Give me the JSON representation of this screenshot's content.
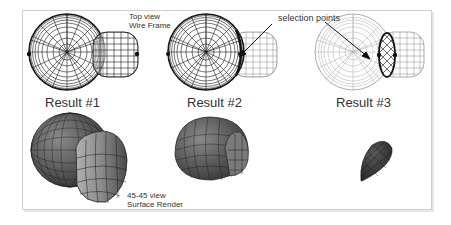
{
  "figure": {
    "panels": [
      {
        "id": "result1",
        "title": "Result #1"
      },
      {
        "id": "result2",
        "title": "Result #2"
      },
      {
        "id": "result3",
        "title": "Result #3"
      }
    ],
    "annotations": {
      "top_view_line1": "Top view",
      "top_view_line2": "Wire Frame",
      "selection_points": "selection points",
      "iso_view_line1": "45-45 view",
      "iso_view_line2": "Surface Render"
    },
    "colors": {
      "wire": "#1a1a1a",
      "wire_faint": "#9a9a9a",
      "surface_dark": "#3a3a3a",
      "surface_mid": "#6e6e6e",
      "surface_light": "#9c9c9c",
      "frame": "#cfcfcf"
    }
  }
}
